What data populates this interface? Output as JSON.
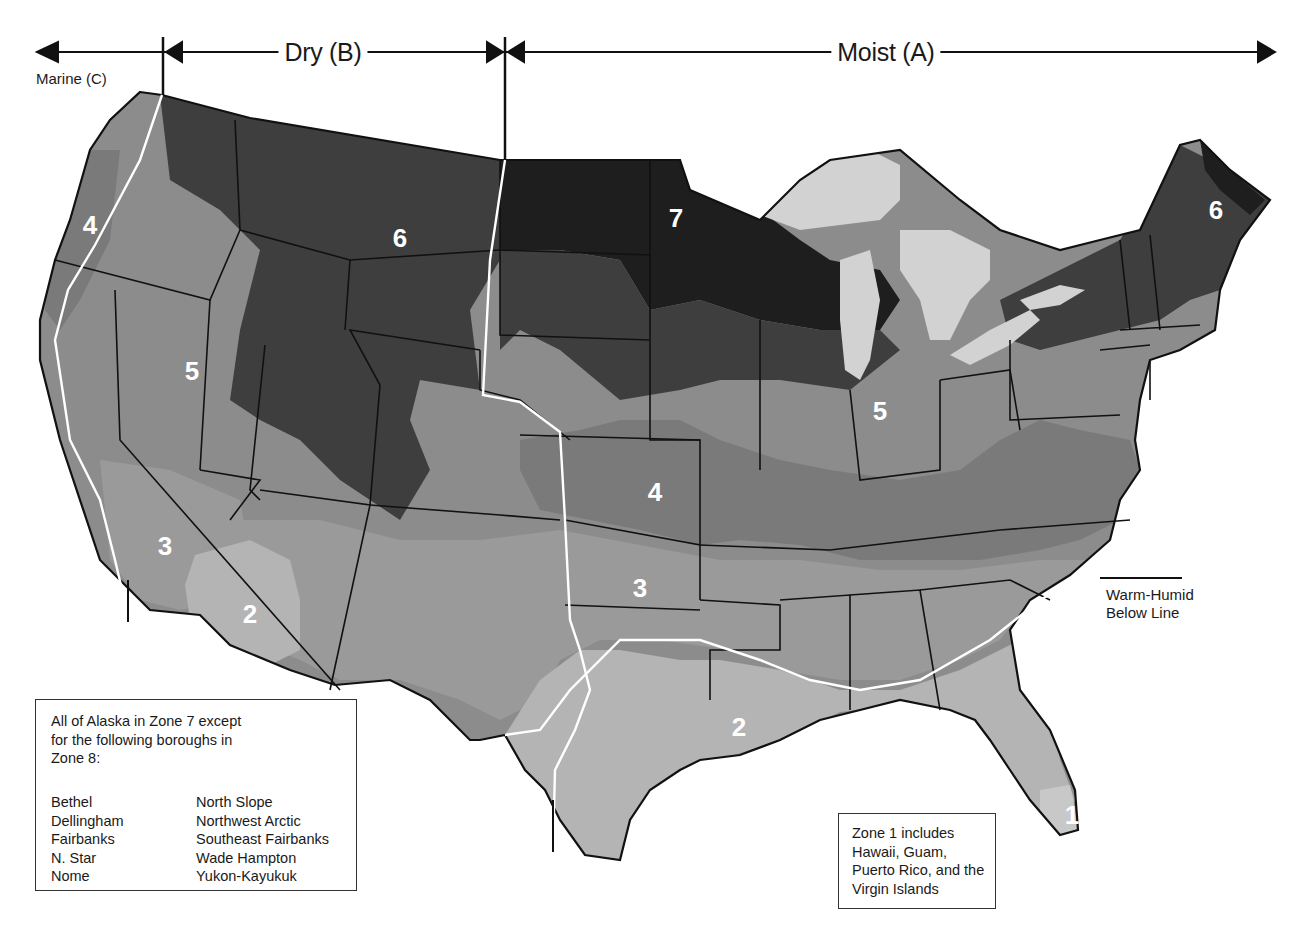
{
  "figure": {
    "moisture_regimes": [
      {
        "id": "marine",
        "label": "Marine (C)"
      },
      {
        "id": "dry",
        "label": "Dry (B)"
      },
      {
        "id": "moist",
        "label": "Moist (A)"
      }
    ],
    "zone_colors": {
      "1": "#c8c8c8",
      "2": "#b4b4b4",
      "3": "#9a9a9a",
      "4": "#7a7a7a",
      "5": "#8c8c8c",
      "6": "#3e3e3e",
      "7": "#1e1e1e",
      "lakes": "#d2d2d2",
      "state_lines": "#111111",
      "climate_lines": "#ffffff"
    },
    "zone_labels": [
      {
        "zone": "4",
        "x": 90,
        "y": 225,
        "region": "Oregon coast"
      },
      {
        "zone": "6",
        "x": 400,
        "y": 238,
        "region": "Montana/Wyoming"
      },
      {
        "zone": "7",
        "x": 676,
        "y": 218,
        "region": "Minnesota"
      },
      {
        "zone": "6",
        "x": 1216,
        "y": 210,
        "region": "Maine"
      },
      {
        "zone": "5",
        "x": 192,
        "y": 371,
        "region": "Nevada"
      },
      {
        "zone": "5",
        "x": 880,
        "y": 411,
        "region": "Indiana"
      },
      {
        "zone": "4",
        "x": 655,
        "y": 492,
        "region": "Kansas/Missouri"
      },
      {
        "zone": "3",
        "x": 165,
        "y": 546,
        "region": "Central California"
      },
      {
        "zone": "3",
        "x": 640,
        "y": 588,
        "region": "Oklahoma"
      },
      {
        "zone": "2",
        "x": 250,
        "y": 614,
        "region": "Arizona"
      },
      {
        "zone": "2",
        "x": 739,
        "y": 727,
        "region": "Louisiana"
      },
      {
        "zone": "1",
        "x": 1072,
        "y": 815,
        "region": "South Florida"
      }
    ],
    "annotations": {
      "warm_humid": {
        "line1": "Warm-Humid",
        "line2": "Below Line"
      }
    },
    "alaska_note": {
      "intro": "All of Alaska in Zone 7 except for the following boroughs in Zone 8:",
      "boroughs_left": [
        "Bethel",
        "Dellingham",
        "Fairbanks",
        "N. Star",
        "Nome"
      ],
      "boroughs_right": [
        "North Slope",
        "Northwest Arctic",
        "Southeast Fairbanks",
        "Wade Hampton",
        "Yukon-Kayukuk"
      ]
    },
    "zone1_note": {
      "text": "Zone 1 includes Hawaii, Guam, Puerto Rico, and the Virgin Islands"
    }
  }
}
